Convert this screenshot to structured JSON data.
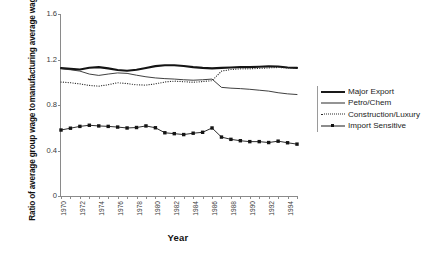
{
  "chart_data": {
    "type": "line",
    "title": "",
    "xlabel": "Year",
    "ylabel": "Ratio of average group wage to manufacturing average wage",
    "ylabel_line1": "Ratio of average group wage to",
    "ylabel_line2": "manufacturing average wage",
    "ylim": [
      0,
      1.6
    ],
    "yticks": [
      "0",
      "0.4",
      "0.8",
      "1.2",
      "1.6"
    ],
    "ytick_values": [
      0,
      0.4,
      0.8,
      1.2,
      1.6
    ],
    "xlim": [
      1970,
      1995
    ],
    "x": [
      1970,
      1971,
      1972,
      1973,
      1974,
      1975,
      1976,
      1977,
      1978,
      1979,
      1980,
      1981,
      1982,
      1983,
      1984,
      1985,
      1986,
      1987,
      1988,
      1989,
      1990,
      1991,
      1992,
      1993,
      1994,
      1995
    ],
    "xticks": [
      1970,
      1972,
      1974,
      1976,
      1978,
      1980,
      1982,
      1984,
      1986,
      1988,
      1990,
      1992,
      1994
    ],
    "xtick_labels": [
      "1970",
      "1972",
      "1974",
      "1976",
      "1978",
      "1980",
      "1982",
      "1984",
      "1986",
      "1988",
      "1990",
      "1992",
      "1994"
    ],
    "grid": false,
    "legend_position": "right",
    "series": [
      {
        "name": "Major Export",
        "style": "thick-solid",
        "color": "#141414",
        "values": [
          1.125,
          1.118,
          1.112,
          1.128,
          1.133,
          1.122,
          1.108,
          1.101,
          1.11,
          1.126,
          1.142,
          1.15,
          1.15,
          1.143,
          1.133,
          1.126,
          1.122,
          1.126,
          1.13,
          1.133,
          1.133,
          1.136,
          1.14,
          1.138,
          1.13,
          1.126
        ]
      },
      {
        "name": "Petro/Chem",
        "style": "thin-solid",
        "color": "#2a2a2a",
        "values": [
          1.118,
          1.11,
          1.098,
          1.072,
          1.06,
          1.072,
          1.082,
          1.078,
          1.062,
          1.048,
          1.038,
          1.032,
          1.028,
          1.022,
          1.018,
          1.022,
          1.028,
          0.955,
          0.948,
          0.944,
          0.938,
          0.93,
          0.922,
          0.908,
          0.898,
          0.892
        ]
      },
      {
        "name": "Construction/Luxury",
        "style": "dotted",
        "color": "#2a2a2a",
        "values": [
          1.002,
          0.996,
          0.986,
          0.972,
          0.966,
          0.978,
          0.996,
          0.988,
          0.978,
          0.975,
          0.986,
          1.002,
          1.01,
          1.005,
          1.0,
          1.006,
          1.014,
          1.098,
          1.112,
          1.118,
          1.118,
          1.122,
          1.126,
          1.13,
          1.126,
          1.122
        ]
      },
      {
        "name": "Import Sensitive",
        "style": "marker-line",
        "color": "#141414",
        "values": [
          0.58,
          0.596,
          0.612,
          0.622,
          0.616,
          0.612,
          0.606,
          0.598,
          0.602,
          0.616,
          0.6,
          0.556,
          0.548,
          0.54,
          0.552,
          0.56,
          0.598,
          0.518,
          0.498,
          0.486,
          0.478,
          0.478,
          0.47,
          0.482,
          0.468,
          0.456
        ]
      }
    ]
  },
  "legend": {
    "items": [
      {
        "label": "Major Export"
      },
      {
        "label": "Petro/Chem"
      },
      {
        "label": "Construction/Luxury"
      },
      {
        "label": "Import Sensitive"
      }
    ]
  },
  "caption": {
    "text": ""
  }
}
